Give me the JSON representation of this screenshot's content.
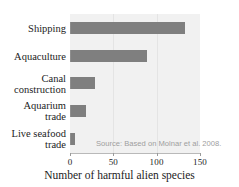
{
  "chart_data": {
    "type": "bar",
    "orientation": "horizontal",
    "title": "",
    "xlabel": "Number of harmful alien species",
    "ylabel": "",
    "xlim": [
      0,
      150
    ],
    "xticks": [
      0,
      50,
      100,
      150
    ],
    "xtick_labels": [
      "0",
      "50",
      "100",
      "150"
    ],
    "grid": true,
    "grid_axis": "x",
    "legend": "none",
    "categories": [
      "Shipping",
      "Aquaculture",
      "Canal construction",
      "Aquarium trade",
      "Live seafood trade"
    ],
    "category_lines": [
      [
        "Shipping"
      ],
      [
        "Aquaculture"
      ],
      [
        "Canal",
        "construction"
      ],
      [
        "Aquarium",
        "trade"
      ],
      [
        "Live seafood",
        "trade"
      ]
    ],
    "values": [
      133,
      89,
      29,
      19,
      6
    ],
    "annotations": [
      "Source: Based on Molnar et al. 2008."
    ],
    "colors": {
      "bar": "#7f7f7f",
      "plot_background": "#f1f1f1",
      "gridline": "#e4e4e4",
      "axis": "#b9b9b9",
      "text": "#1c1c1c",
      "annotation_text": "#9e9e9e",
      "figure_background": "#ffffff"
    }
  }
}
